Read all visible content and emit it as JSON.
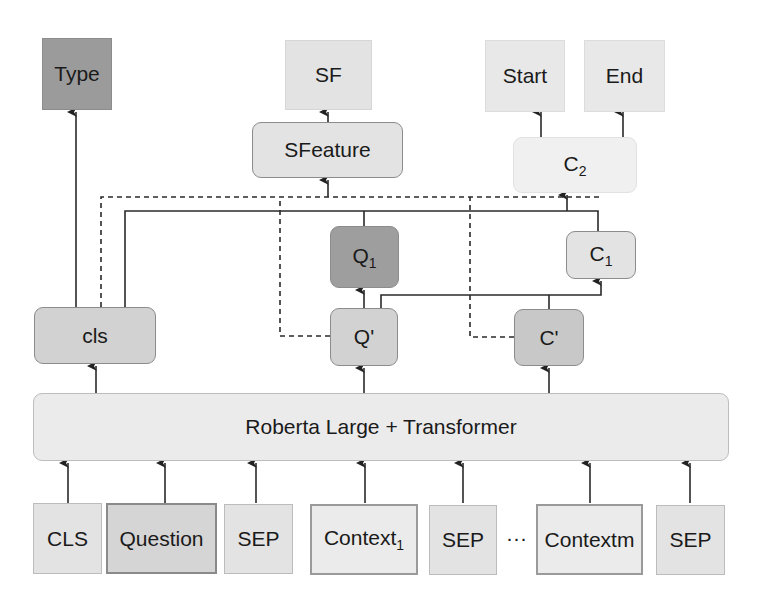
{
  "diagram": {
    "outputs": {
      "type": "Type",
      "sf": "SF",
      "start": "Start",
      "end": "End"
    },
    "modules": {
      "sfeature": "SFeature",
      "c2": "C",
      "c2_sub": "2",
      "q1": "Q",
      "q1_sub": "1",
      "c1": "C",
      "c1_sub": "1",
      "cls": "cls",
      "q_prime": "Q'",
      "c_prime": "C'"
    },
    "encoder": {
      "label": "Roberta Large + Transformer"
    },
    "inputs": [
      {
        "label": "CLS"
      },
      {
        "label": "Question"
      },
      {
        "label": "SEP"
      },
      {
        "label": "Context",
        "sub": "1"
      },
      {
        "label": "SEP"
      },
      {
        "label": "Contextm"
      },
      {
        "label": "SEP"
      }
    ],
    "ellipsis": "···",
    "colors": {
      "dark": "#9b9b9b",
      "medium": "#cfcfcf",
      "light": "#e3e3e3",
      "lighter": "#eeeeee",
      "line": "#2a2a2a"
    }
  }
}
